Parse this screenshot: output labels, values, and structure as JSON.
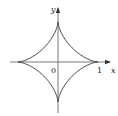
{
  "figure": {
    "type": "astroid",
    "colors": {
      "background": "#ffffff",
      "curve": "#333333",
      "axes": "#444444",
      "text": "#222222"
    },
    "axes": {
      "x_label": "x",
      "y_label": "y",
      "origin_label": "0",
      "x_tick_label": "1"
    },
    "geometry": {
      "origin_px": [
        58,
        62
      ],
      "radius_px": 40,
      "x_axis_extent_px": [
        10,
        111
      ],
      "y_axis_extent_px": [
        7,
        113
      ]
    }
  }
}
